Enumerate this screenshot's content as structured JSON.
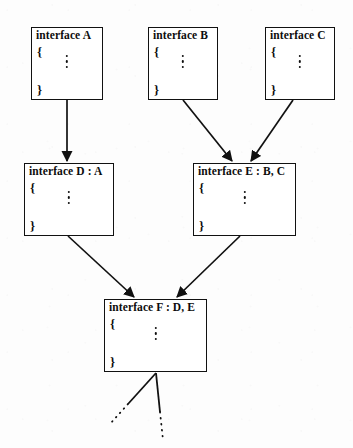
{
  "diagram": {
    "background_color": "#fdfdfd",
    "line_color": "#111111",
    "text_color": "#0d0d0d",
    "body_open_brace": "{",
    "body_close_brace": "}",
    "body_ellipsis": "vertical-ellipsis",
    "nodes": [
      {
        "id": "A",
        "title": "interface A",
        "x": 31,
        "y": 27,
        "w": 72,
        "h": 73
      },
      {
        "id": "B",
        "title": "interface B",
        "x": 148,
        "y": 27,
        "w": 70,
        "h": 73
      },
      {
        "id": "C",
        "title": "interface C",
        "x": 265,
        "y": 27,
        "w": 70,
        "h": 73
      },
      {
        "id": "D",
        "title": "interface D : A",
        "x": 24,
        "y": 163,
        "w": 90,
        "h": 73
      },
      {
        "id": "E",
        "title": "interface E : B, C",
        "x": 193,
        "y": 163,
        "w": 103,
        "h": 73
      },
      {
        "id": "F",
        "title": "interface F : D, E",
        "x": 104,
        "y": 299,
        "w": 103,
        "h": 73
      }
    ],
    "edges": [
      {
        "from": "A",
        "to": "D",
        "kind": "arrow",
        "x1": 67,
        "y1": 100,
        "x2": 67,
        "y2": 161
      },
      {
        "from": "B",
        "to": "E",
        "kind": "arrow",
        "x1": 183,
        "y1": 100,
        "x2": 232,
        "y2": 161
      },
      {
        "from": "C",
        "to": "E",
        "kind": "arrow",
        "x1": 293,
        "y1": 100,
        "x2": 251,
        "y2": 161
      },
      {
        "from": "D",
        "to": "F",
        "kind": "arrow",
        "x1": 68,
        "y1": 236,
        "x2": 134,
        "y2": 297
      },
      {
        "from": "E",
        "to": "F",
        "kind": "arrow",
        "x1": 240,
        "y1": 236,
        "x2": 177,
        "y2": 297
      }
    ],
    "tails": [
      {
        "id": "tail-left",
        "kind": "solid-then-dotted",
        "x1": 156,
        "y1": 373,
        "x2": 128,
        "y2": 404,
        "dot_x2": 110,
        "dot_y2": 424
      },
      {
        "id": "tail-right",
        "kind": "solid-then-dotted",
        "x1": 156,
        "y1": 373,
        "x2": 160,
        "y2": 412,
        "dot_x2": 163,
        "dot_y2": 440
      }
    ]
  }
}
